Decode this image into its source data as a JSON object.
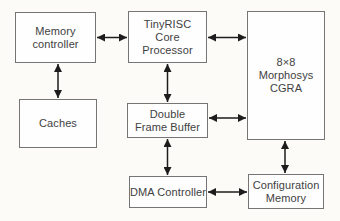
{
  "diagram": {
    "boxes": {
      "memory_controller": {
        "label": "Memory\ncontroller"
      },
      "tinyrisc": {
        "label": "TinyRISC\nCore\nProcessor"
      },
      "cgra": {
        "label": "8×8\nMorphosys\nCGRA"
      },
      "caches": {
        "label": "Caches"
      },
      "double_frame_buffer": {
        "label": "Double\nFrame Buffer"
      },
      "dma_controller": {
        "label": "DMA Controller"
      },
      "configuration_memory": {
        "label": "Configuration\nMemory"
      }
    },
    "connections": [
      {
        "from": "Memory controller",
        "to": "TinyRISC Core Processor",
        "style": "bidirectional-arrow"
      },
      {
        "from": "TinyRISC Core Processor",
        "to": "8×8 Morphosys CGRA",
        "style": "bidirectional-arrow"
      },
      {
        "from": "Memory controller",
        "to": "Caches",
        "style": "bidirectional-arrow"
      },
      {
        "from": "TinyRISC Core Processor",
        "to": "Double Frame Buffer",
        "style": "bidirectional-arrow"
      },
      {
        "from": "Double Frame Buffer",
        "to": "8×8 Morphosys CGRA",
        "style": "bidirectional-arrow"
      },
      {
        "from": "Double Frame Buffer",
        "to": "DMA Controller",
        "style": "bidirectional-arrow"
      },
      {
        "from": "DMA Controller",
        "to": "Configuration Memory",
        "style": "bidirectional-arrow"
      },
      {
        "from": "8×8 Morphosys CGRA",
        "to": "Configuration Memory",
        "style": "bidirectional-arrow"
      }
    ],
    "colors": {
      "background": "#fcfbf8",
      "box_fill": "#fefefe",
      "box_border": "#757575",
      "arrow": "#1d1d1d",
      "text": "#414141"
    }
  }
}
